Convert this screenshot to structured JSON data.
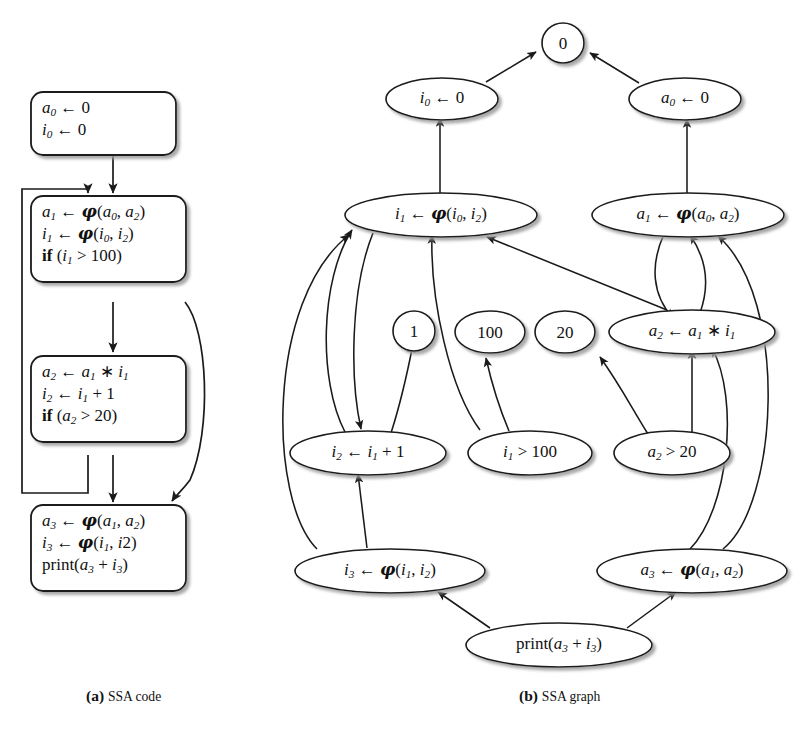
{
  "figure": {
    "panels": [
      {
        "key": "a",
        "tag": "(a)",
        "title": "SSA code"
      },
      {
        "key": "b",
        "tag": "(b)",
        "title": "SSA graph"
      }
    ],
    "colors": {
      "stroke": "#1a1a1a",
      "fill": "#ffffff",
      "shadow": "#b9b9b9",
      "text": "#111111",
      "background": "#ffffff"
    }
  },
  "ssa_code": {
    "blocks": [
      {
        "id": "b0",
        "lines": [
          {
            "text": "a0 ← 0",
            "html": "<span class=\"v\">a</span><sub>0</sub> <span class=\"op\">←</span> <span class=\"num\">0</span>"
          },
          {
            "text": "i0 ← 0",
            "html": "<span class=\"v\">i</span><sub>0</sub> <span class=\"op\">←</span> <span class=\"num\">0</span>"
          }
        ]
      },
      {
        "id": "b1",
        "lines": [
          {
            "text": "a1 ← φ(a0, a2)",
            "html": "<span class=\"v\">a</span><sub>1</sub> <span class=\"op\">←</span> <span class=\"ph\">φ</span>(<span class=\"v\">a</span><sub>0</sub>, <span class=\"v\">a</span><sub>2</sub>)"
          },
          {
            "text": "i1 ← φ(i0, i2)",
            "html": "<span class=\"v\">i</span><sub>1</sub> <span class=\"op\">←</span> <span class=\"ph\">φ</span>(<span class=\"v\">i</span><sub>0</sub>, <span class=\"v\">i</span><sub>2</sub>)"
          },
          {
            "text": "if (i1 > 100)",
            "html": "<span class=\"kw\">if</span> (<span class=\"v\">i</span><sub>1</sub> <span class=\"op\">&gt;</span> <span class=\"num\">100</span>)"
          }
        ]
      },
      {
        "id": "b2",
        "lines": [
          {
            "text": "a2 ← a1 * i1",
            "html": "<span class=\"v\">a</span><sub>2</sub> <span class=\"op\">←</span> <span class=\"v\">a</span><sub>1</sub> <span class=\"op\">∗</span> <span class=\"v\">i</span><sub>1</sub>"
          },
          {
            "text": "i2 ← i1 + 1",
            "html": "<span class=\"v\">i</span><sub>2</sub> <span class=\"op\">←</span> <span class=\"v\">i</span><sub>1</sub> <span class=\"op\">+</span> <span class=\"num\">1</span>"
          },
          {
            "text": "if (a2 > 20)",
            "html": "<span class=\"kw\">if</span> (<span class=\"v\">a</span><sub>2</sub> <span class=\"op\">&gt;</span> <span class=\"num\">20</span>)"
          }
        ]
      },
      {
        "id": "b3",
        "lines": [
          {
            "text": "a3 ← φ(a1, a2)",
            "html": "<span class=\"v\">a</span><sub>3</sub> <span class=\"op\">←</span> <span class=\"ph\">φ</span>(<span class=\"v\">a</span><sub>1</sub>, <span class=\"v\">a</span><sub>2</sub>)"
          },
          {
            "text": "i3 ← φ(i1, i2)",
            "html": "<span class=\"v\">i</span><sub>3</sub> <span class=\"op\">←</span> <span class=\"ph\">φ</span>(<span class=\"v\">i</span><sub>1</sub>, <span class=\"v\">i</span>2)"
          },
          {
            "text": "print(a3 + i3)",
            "html": "<span class=\"fn\">print</span>(<span class=\"v\">a</span><sub>3</sub> <span class=\"op\">+</span> <span class=\"v\">i</span><sub>3</sub>)"
          }
        ]
      }
    ]
  },
  "ssa_graph": {
    "nodes": [
      {
        "id": "zero",
        "text": "0",
        "html": "<span class=\"num\">0</span>"
      },
      {
        "id": "i0",
        "text": "i0 ← 0",
        "html": "<span class=\"v\">i</span><sub>0</sub> <span class=\"op\">←</span> <span class=\"num\">0</span>"
      },
      {
        "id": "a0",
        "text": "a0 ← 0",
        "html": "<span class=\"v\">a</span><sub>0</sub> <span class=\"op\">←</span> <span class=\"num\">0</span>"
      },
      {
        "id": "i1phi",
        "text": "i1 ← φ(i0, i2)",
        "html": "<span class=\"v\">i</span><sub>1</sub> <span class=\"op\">←</span> <span class=\"ph\">φ</span>(<span class=\"v\">i</span><sub>0</sub>, <span class=\"v\">i</span><sub>2</sub>)"
      },
      {
        "id": "a1phi",
        "text": "a1 ← φ(a0, a2)",
        "html": "<span class=\"v\">a</span><sub>1</sub> <span class=\"op\">←</span> <span class=\"ph\">φ</span>(<span class=\"v\">a</span><sub>0</sub>, <span class=\"v\">a</span><sub>2</sub>)"
      },
      {
        "id": "one",
        "text": "1",
        "html": "<span class=\"num\">1</span>"
      },
      {
        "id": "hund",
        "text": "100",
        "html": "<span class=\"num\">100</span>"
      },
      {
        "id": "twenty",
        "text": "20",
        "html": "<span class=\"num\">20</span>"
      },
      {
        "id": "a2mul",
        "text": "a2 ← a1 * i1",
        "html": "<span class=\"v\">a</span><sub>2</sub> <span class=\"op\">←</span> <span class=\"v\">a</span><sub>1</sub> <span class=\"op\">∗</span> <span class=\"v\">i</span><sub>1</sub>"
      },
      {
        "id": "i2add",
        "text": "i2 ← i1 + 1",
        "html": "<span class=\"v\">i</span><sub>2</sub> <span class=\"op\">←</span> <span class=\"v\">i</span><sub>1</sub> <span class=\"op\">+</span> <span class=\"num\">1</span>"
      },
      {
        "id": "i1cmp",
        "text": "i1 > 100",
        "html": "<span class=\"v\">i</span><sub>1</sub> <span class=\"op\">&gt;</span> <span class=\"num\">100</span>"
      },
      {
        "id": "a2cmp",
        "text": "a2 > 20",
        "html": "<span class=\"v\">a</span><sub>2</sub> <span class=\"op\">&gt;</span> <span class=\"num\">20</span>"
      },
      {
        "id": "i3phi",
        "text": "i3 ← φ(i1, i2)",
        "html": "<span class=\"v\">i</span><sub>3</sub> <span class=\"op\">←</span> <span class=\"ph\">φ</span>(<span class=\"v\">i</span><sub>1</sub>, <span class=\"v\">i</span><sub>2</sub>)"
      },
      {
        "id": "a3phi",
        "text": "a3 ← φ(a1, a2)",
        "html": "<span class=\"v\">a</span><sub>3</sub> <span class=\"op\">←</span> <span class=\"ph\">φ</span>(<span class=\"v\">a</span><sub>1</sub>, <span class=\"v\">a</span><sub>2</sub>)"
      },
      {
        "id": "print",
        "text": "print(a3 + i3)",
        "html": "<span class=\"fn\">print</span>(<span class=\"v\">a</span><sub>3</sub> <span class=\"op\">+</span> <span class=\"v\">i</span><sub>3</sub>)"
      }
    ],
    "edges": [
      {
        "from": "i0",
        "to": "zero"
      },
      {
        "from": "a0",
        "to": "zero"
      },
      {
        "from": "i1phi",
        "to": "i0"
      },
      {
        "from": "a1phi",
        "to": "a0"
      },
      {
        "from": "i1phi",
        "to": "i2add"
      },
      {
        "from": "i2add",
        "to": "i1phi"
      },
      {
        "from": "i2add",
        "to": "one"
      },
      {
        "from": "i1cmp",
        "to": "i1phi"
      },
      {
        "from": "i1cmp",
        "to": "hund"
      },
      {
        "from": "a2mul",
        "to": "i1phi"
      },
      {
        "from": "i3phi",
        "to": "i1phi"
      },
      {
        "from": "a1phi",
        "to": "a2mul"
      },
      {
        "from": "a2mul",
        "to": "a1phi"
      },
      {
        "from": "a2cmp",
        "to": "a2mul"
      },
      {
        "from": "a2cmp",
        "to": "twenty"
      },
      {
        "from": "a3phi",
        "to": "a2mul"
      },
      {
        "from": "a3phi",
        "to": "a1phi"
      },
      {
        "from": "i3phi",
        "to": "i2add"
      },
      {
        "from": "print",
        "to": "i3phi"
      },
      {
        "from": "print",
        "to": "a3phi"
      }
    ]
  },
  "cfg_edges": [
    {
      "from": "b0",
      "to": "b1",
      "label": "fallthrough"
    },
    {
      "from": "b1",
      "to": "b2",
      "label": "fallthrough"
    },
    {
      "from": "b1",
      "to": "b3",
      "label": "branch-exit"
    },
    {
      "from": "b2",
      "to": "b1",
      "label": "loop-back"
    },
    {
      "from": "b2",
      "to": "b3",
      "label": "fallthrough"
    }
  ]
}
